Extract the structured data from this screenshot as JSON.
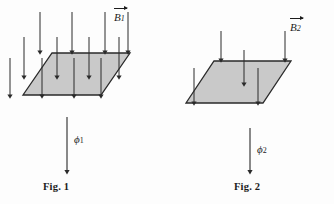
{
  "figure": {
    "background_color": "#fdfdfd",
    "ink_color": "#1c1c1c",
    "surface_fill": "#c9c9c9",
    "surface_stroke": "#2a2a2a",
    "panels": [
      {
        "id": "panel-1",
        "caption": "Fig. 1",
        "field_label_base": "B",
        "field_label_sub": "1",
        "flux_label_base": "ϕ",
        "flux_label_sub": "1",
        "surface": {
          "points": "23,95 52,53 130,53 101,95",
          "description": "tilted parallelogram surface"
        },
        "field_arrows": [
          {
            "x1": 40,
            "y1": 12,
            "x2": 40,
            "y2": 53
          },
          {
            "x1": 72,
            "y1": 12,
            "x2": 72,
            "y2": 53
          },
          {
            "x1": 105,
            "y1": 12,
            "x2": 105,
            "y2": 53
          },
          {
            "x1": 128,
            "y1": 12,
            "x2": 128,
            "y2": 53
          },
          {
            "x1": 24,
            "y1": 37,
            "x2": 24,
            "y2": 78
          },
          {
            "x1": 57,
            "y1": 37,
            "x2": 57,
            "y2": 78
          },
          {
            "x1": 89,
            "y1": 37,
            "x2": 89,
            "y2": 78
          },
          {
            "x1": 119,
            "y1": 37,
            "x2": 119,
            "y2": 78
          },
          {
            "x1": 10,
            "y1": 58,
            "x2": 10,
            "y2": 97
          },
          {
            "x1": 42,
            "y1": 58,
            "x2": 42,
            "y2": 97
          },
          {
            "x1": 74,
            "y1": 58,
            "x2": 74,
            "y2": 97
          },
          {
            "x1": 101,
            "y1": 58,
            "x2": 101,
            "y2": 97
          }
        ],
        "flux_arrow": {
          "x1": 67,
          "y1": 117,
          "x2": 67,
          "y2": 173
        },
        "caption_x": 67,
        "caption_y": 188,
        "field_label_x": 114,
        "field_label_y": 12,
        "flux_label_x": 74,
        "flux_label_y": 134
      },
      {
        "id": "panel-2",
        "caption": "Fig. 2",
        "field_label_base": "B",
        "field_label_sub": "2",
        "flux_label_base": "ϕ",
        "flux_label_sub": "2",
        "surface": {
          "points": "186,103 214,61 291,61 263,103",
          "description": "tilted parallelogram surface"
        },
        "field_arrows": [
          {
            "x1": 221,
            "y1": 31,
            "x2": 221,
            "y2": 61
          },
          {
            "x1": 285,
            "y1": 31,
            "x2": 285,
            "y2": 61
          },
          {
            "x1": 244,
            "y1": 50,
            "x2": 244,
            "y2": 85
          },
          {
            "x1": 194,
            "y1": 68,
            "x2": 194,
            "y2": 104
          },
          {
            "x1": 258,
            "y1": 68,
            "x2": 258,
            "y2": 104
          }
        ],
        "flux_arrow": {
          "x1": 250,
          "y1": 128,
          "x2": 250,
          "y2": 173
        },
        "caption_x": 258,
        "caption_y": 188,
        "field_label_x": 290,
        "field_label_y": 22,
        "flux_label_x": 257,
        "flux_label_y": 144
      }
    ]
  }
}
